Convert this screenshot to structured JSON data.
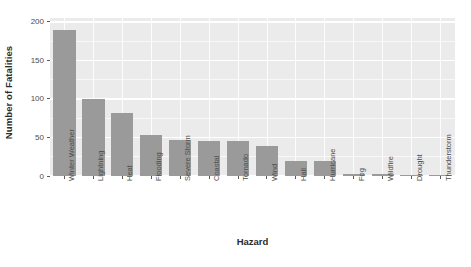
{
  "chart_data": {
    "type": "bar",
    "title": "",
    "xlabel": "Hazard",
    "ylabel": "Number of Fatalities",
    "categories": [
      "Winter Weather",
      "Lightning",
      "Heat",
      "Flooding",
      "Severe Storm",
      "Coastal",
      "Tornado",
      "Wind",
      "Hail",
      "Hurricane",
      "Fog",
      "Wildfire",
      "Drought",
      "Thunderstorm"
    ],
    "values": [
      190,
      100,
      82,
      53,
      47,
      46,
      46,
      39,
      20,
      20,
      3,
      2,
      0,
      0
    ],
    "ylim": [
      0,
      205
    ],
    "y_ticks": [
      0,
      50,
      100,
      150,
      200
    ],
    "y_tick_labels": [
      "0",
      "50",
      "100",
      "150",
      "200"
    ],
    "y_minor_ticks": [
      25,
      75,
      125,
      175
    ],
    "grid": "on",
    "legend": "none",
    "bar_color": "#9a9a9a",
    "panel_color": "#ebebeb",
    "grid_color": "#ffffff"
  }
}
